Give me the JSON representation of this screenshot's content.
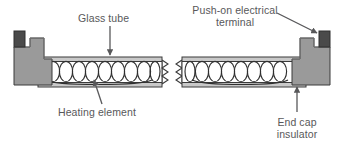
{
  "diagram": {
    "background_color": "#ffffff",
    "labels": {
      "glass_tube": "Glass tube",
      "push_on_terminal_line1": "Push-on electrical",
      "push_on_terminal_line2": "terminal",
      "heating_element": "Heating element",
      "end_cap_line1": "End cap",
      "end_cap_line2": "insulator"
    },
    "colors": {
      "line": "#3a3a3a",
      "text": "#58585a",
      "end_cap_fill": "#9a9a9a",
      "end_cap_fill_light": "#a8a8a8",
      "terminal_fill": "#4a4a4a",
      "tube_wall_fill": "#c9c9c9",
      "tube_interior_fill": "#ffffff",
      "coil_stroke": "#2f2f2f"
    },
    "parts": [
      {
        "name": "glass-tube",
        "count": 2,
        "description": "horizontal double-walled tube, broken in middle"
      },
      {
        "name": "heating-element-coil",
        "count": 17,
        "description": "helical wire loops inside tube"
      },
      {
        "name": "end-cap-insulator",
        "count": 2,
        "description": "stepped grey block at each tube end"
      },
      {
        "name": "push-on-electrical-terminal",
        "count": 2,
        "description": "small dark block on top of each end cap"
      },
      {
        "name": "break-mark",
        "count": 2,
        "description": "zig-zag cut symbol at centre of tube"
      }
    ],
    "annotations": [
      {
        "name": "glass-tube",
        "arrow": "down",
        "points_to": "tube top wall"
      },
      {
        "name": "push-on-electrical-terminal",
        "arrow": "diagonal-down-right",
        "points_to": "right terminal"
      },
      {
        "name": "heating-element",
        "arrow": "up",
        "points_to": "coil loop"
      },
      {
        "name": "end-cap-insulator",
        "arrow": "up",
        "points_to": "right end cap"
      }
    ]
  }
}
